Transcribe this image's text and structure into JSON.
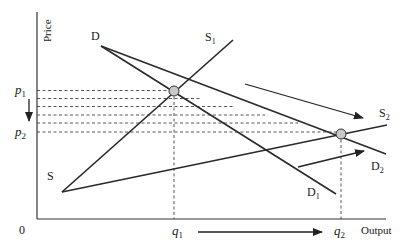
{
  "diagram": {
    "type": "supply-demand",
    "axes": {
      "y_label": "Price",
      "x_label": "Output",
      "origin_label": "0"
    },
    "price_labels": {
      "p1": {
        "base": "p",
        "sub": "1"
      },
      "p2": {
        "base": "p",
        "sub": "2"
      }
    },
    "quantity_labels": {
      "q1": {
        "base": "q",
        "sub": "1"
      },
      "q2": {
        "base": "q",
        "sub": "2"
      }
    },
    "curves": {
      "D": {
        "label": "D"
      },
      "S": {
        "label": "S"
      },
      "S1": {
        "base": "S",
        "sub": "1"
      },
      "S2": {
        "base": "S",
        "sub": "2"
      },
      "D1": {
        "base": "D",
        "sub": "1"
      },
      "D2": {
        "base": "D",
        "sub": "2"
      }
    },
    "equilibria": [
      {
        "name": "initial",
        "price": "p1",
        "quantity": "q1"
      },
      {
        "name": "new",
        "price": "p2",
        "quantity": "q2"
      }
    ],
    "colors": {
      "line": "#2a2a2a",
      "equilibrium_fill": "#c8c8c8",
      "background": "#ffffff"
    }
  }
}
